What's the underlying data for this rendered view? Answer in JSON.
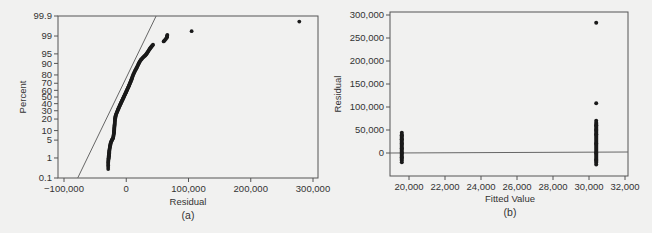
{
  "chart_data": [
    {
      "id": "a",
      "type": "scatter",
      "subtype": "normal probability plot",
      "panel_label": "(a)",
      "title": "",
      "xlabel": "Residual",
      "ylabel": "Percent",
      "xlim": [
        -110000,
        300000
      ],
      "ylim": [
        0.1,
        99.9
      ],
      "x_ticks": [
        -100000,
        0,
        100000,
        200000,
        300000
      ],
      "x_tick_labels": [
        "−100,000",
        "0",
        "100,000",
        "200,000",
        "300,000"
      ],
      "y_ticks": [
        0.1,
        1,
        5,
        10,
        20,
        30,
        40,
        50,
        60,
        70,
        80,
        90,
        95,
        99,
        99.9
      ],
      "y_tick_labels": [
        "0.1",
        "1",
        "5",
        "10",
        "20",
        "30",
        "40",
        "50",
        "60",
        "70",
        "80",
        "90",
        "95",
        "99",
        "99.9"
      ],
      "grid": false,
      "reference_line": {
        "from": [
          -78000,
          0.1
        ],
        "to": [
          48000,
          99.9
        ]
      },
      "series": [
        {
          "name": "Residuals",
          "points": [
            [
              -29000,
              0.3
            ],
            [
              -29000,
              0.6
            ],
            [
              -28500,
              0.9
            ],
            [
              -28000,
              1.2
            ],
            [
              -27500,
              1.6
            ],
            [
              -27000,
              2.2
            ],
            [
              -26000,
              3
            ],
            [
              -25000,
              4
            ],
            [
              -23000,
              5
            ],
            [
              -21000,
              6
            ],
            [
              -20000,
              8
            ],
            [
              -19500,
              10
            ],
            [
              -19000,
              13
            ],
            [
              -18500,
              16
            ],
            [
              -18000,
              20
            ],
            [
              -17000,
              24
            ],
            [
              -15000,
              28
            ],
            [
              -13000,
              32
            ],
            [
              -11000,
              36
            ],
            [
              -9000,
              40
            ],
            [
              -7000,
              44
            ],
            [
              -5000,
              48
            ],
            [
              -3000,
              52
            ],
            [
              -1000,
              56
            ],
            [
              1000,
              60
            ],
            [
              3000,
              64
            ],
            [
              5000,
              68
            ],
            [
              7000,
              72
            ],
            [
              9000,
              76
            ],
            [
              11000,
              80
            ],
            [
              14000,
              84
            ],
            [
              17000,
              87
            ],
            [
              20000,
              90
            ],
            [
              23000,
              92
            ],
            [
              27000,
              93.5
            ],
            [
              31000,
              94.5
            ],
            [
              34000,
              95.5
            ],
            [
              37000,
              96.5
            ],
            [
              40000,
              97.2
            ],
            [
              43000,
              97.7
            ],
            [
              60000,
              98.3
            ],
            [
              65000,
              98.8
            ],
            [
              66000,
              99.1
            ],
            [
              105000,
              99.4
            ],
            [
              278000,
              99.8
            ]
          ]
        }
      ]
    },
    {
      "id": "b",
      "type": "scatter",
      "subtype": "residuals versus fits",
      "panel_label": "(b)",
      "title": "",
      "xlabel": "Fitted Value",
      "ylabel": "Residual",
      "xlim": [
        19000,
        32200
      ],
      "ylim": [
        -30000,
        305000
      ],
      "x_ticks": [
        20000,
        22000,
        24000,
        26000,
        28000,
        30000,
        32000
      ],
      "x_tick_labels": [
        "20,000",
        "22,000",
        "24,000",
        "26,000",
        "28,000",
        "30,000",
        "32,000"
      ],
      "y_ticks": [
        0,
        50000,
        100000,
        150000,
        200000,
        250000,
        300000
      ],
      "y_tick_labels": [
        "0",
        "50,000",
        "100,000",
        "150,000",
        "200,000",
        "250,000",
        "300,000"
      ],
      "grid": false,
      "reference_line": {
        "y": 0
      },
      "series": [
        {
          "name": "Group 1 (fitted ≈ 19,600)",
          "fitted_value": 19600,
          "residual_range": [
            -20000,
            44000
          ],
          "points": [
            [
              19600,
              44000
            ],
            [
              19600,
              38000
            ],
            [
              19600,
              30000
            ],
            [
              19600,
              20000
            ],
            [
              19600,
              10000
            ],
            [
              19600,
              0
            ],
            [
              19600,
              -10000
            ],
            [
              19600,
              -20000
            ]
          ]
        },
        {
          "name": "Group 2 (fitted ≈ 30,400)",
          "fitted_value": 30400,
          "residual_range": [
            -25000,
            283000
          ],
          "points": [
            [
              30400,
              283000
            ],
            [
              30400,
              108000
            ],
            [
              30400,
              70000
            ],
            [
              30400,
              60000
            ],
            [
              30400,
              50000
            ],
            [
              30400,
              40000
            ],
            [
              30400,
              20000
            ],
            [
              30400,
              0
            ],
            [
              30400,
              -15000
            ],
            [
              30400,
              -25000
            ]
          ]
        }
      ]
    }
  ],
  "colors": {
    "background": "#f1f1f0",
    "frame": "#555555",
    "points": "#1a1a1a",
    "reference_line": "#666666",
    "text": "#333333"
  }
}
